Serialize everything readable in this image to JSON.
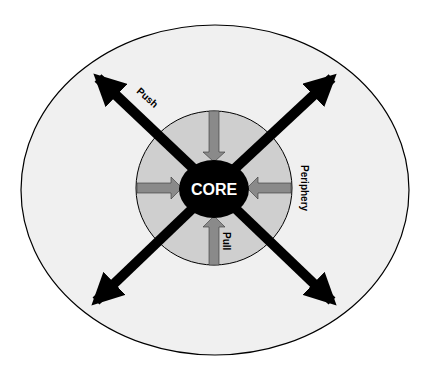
{
  "diagram": {
    "core_label": "CORE",
    "periphery_label": "Periphery",
    "push_label": "Push",
    "pull_label": "Pull",
    "colors": {
      "background": "#ffffff",
      "outer_fill": "#f0f0f0",
      "inner_fill": "#cfcfcf",
      "core_fill": "#000000",
      "push_arrow": "#000000",
      "pull_arrow": "#8a8a8a",
      "core_text": "#ffffff"
    },
    "push_arrows": [
      "top-left",
      "top-right",
      "bottom-left",
      "bottom-right"
    ],
    "pull_arrows": [
      "top",
      "left",
      "right",
      "bottom"
    ]
  }
}
